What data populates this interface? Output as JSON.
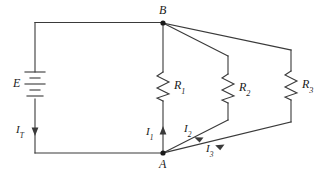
{
  "figure": {
    "stroke_color": "#3a3a3a",
    "label_color": "#1a1a1a",
    "background": "#ffffff",
    "width": 329,
    "height": 177
  },
  "nodes": [
    {
      "id": "B",
      "label": "B",
      "x": 163,
      "y": 23
    },
    {
      "id": "A",
      "label": "A",
      "x": 163,
      "y": 153
    }
  ],
  "source": {
    "name": "battery",
    "label": "E",
    "x": 35,
    "y": 85
  },
  "resistors": [
    {
      "id": "R1",
      "label": "R",
      "subscript": "1",
      "x": 163,
      "y": 86
    },
    {
      "id": "R2",
      "label": "R",
      "subscript": "2",
      "x": 228,
      "y": 88
    },
    {
      "id": "R3",
      "label": "R",
      "subscript": "3",
      "x": 291,
      "y": 85
    }
  ],
  "currents": [
    {
      "id": "IT",
      "label": "I",
      "subscript": "T",
      "direction": "down",
      "x": 35,
      "y": 130
    },
    {
      "id": "I1",
      "label": "I",
      "subscript": "1",
      "direction": "up",
      "x": 163,
      "y": 133
    },
    {
      "id": "I2",
      "label": "I",
      "subscript": "2",
      "direction": "up-right",
      "x": 196,
      "y": 130
    },
    {
      "id": "I3",
      "label": "I",
      "subscript": "3",
      "direction": "up-right",
      "x": 218,
      "y": 148
    }
  ],
  "labels": {
    "node_b": "B",
    "node_a": "A",
    "source_e": "E",
    "r1": "R",
    "r1_sub": "1",
    "r2": "R",
    "r2_sub": "2",
    "r3": "R",
    "r3_sub": "3",
    "it": "I",
    "it_sub": "T",
    "i1": "I",
    "i1_sub": "1",
    "i2": "I",
    "i2_sub": "2",
    "i3": "I",
    "i3_sub": "3"
  }
}
